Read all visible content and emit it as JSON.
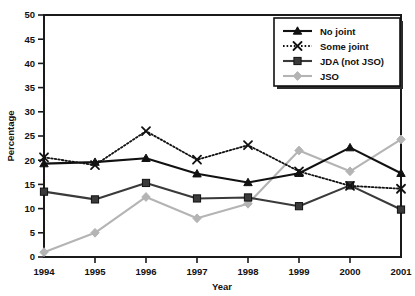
{
  "chart_data": {
    "type": "line",
    "title": "",
    "xlabel": "Year",
    "ylabel": "Percentage",
    "categories": [
      "1994",
      "1995",
      "1996",
      "1997",
      "1998",
      "1999",
      "2000",
      "2001"
    ],
    "x": [
      1994,
      1995,
      1996,
      1997,
      1998,
      1999,
      2000,
      2001
    ],
    "xlim": [
      1994,
      2001
    ],
    "ylim": [
      0,
      50
    ],
    "ytick_labels": [
      "0",
      "5",
      "10",
      "15",
      "20",
      "25",
      "30",
      "35",
      "40",
      "45",
      "50"
    ],
    "yticks": [
      0,
      5,
      10,
      15,
      20,
      25,
      30,
      35,
      40,
      45,
      50
    ],
    "grid": false,
    "legend_position": "top-right",
    "series": [
      {
        "name": "No joint",
        "values": [
          19.3,
          19.6,
          20.4,
          17.2,
          15.4,
          17.3,
          22.6,
          17.3
        ],
        "color": "#111111",
        "line_style": "solid",
        "marker": "triangle"
      },
      {
        "name": "Some joint",
        "values": [
          20.6,
          19.0,
          26.0,
          20.1,
          23.1,
          17.7,
          14.7,
          14.1
        ],
        "color": "#111111",
        "line_style": "dotted",
        "marker": "x"
      },
      {
        "name": "JDA (not JSO)",
        "values": [
          13.5,
          11.9,
          15.3,
          12.1,
          12.3,
          10.5,
          14.8,
          9.8
        ],
        "color": "#3a3a3a",
        "line_style": "solid",
        "marker": "square"
      },
      {
        "name": "JSO",
        "values": [
          1.0,
          5.0,
          12.4,
          8.0,
          11.0,
          22.0,
          17.7,
          24.3
        ],
        "color": "#b4b4b4",
        "line_style": "solid",
        "marker": "diamond"
      }
    ]
  },
  "axes": {
    "y_title": "Percentage",
    "x_title": "Year"
  },
  "legend": {
    "items": [
      {
        "label": "No joint"
      },
      {
        "label": "Some joint"
      },
      {
        "label": "JDA (not JSO)"
      },
      {
        "label": "JSO"
      }
    ]
  }
}
